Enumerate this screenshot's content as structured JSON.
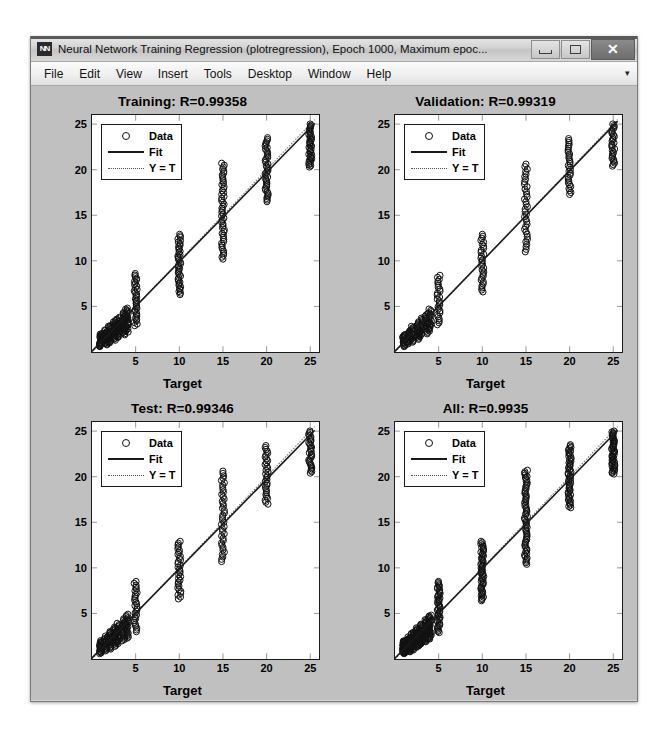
{
  "window": {
    "title": "Neural Network Training Regression (plotregression), Epoch 1000, Maximum epoc...",
    "app_icon": "matlab-nn-icon",
    "controls": {
      "minimize": "minimize-button",
      "maximize": "maximize-button",
      "close": "✕"
    }
  },
  "menubar": {
    "items": [
      {
        "label": "File"
      },
      {
        "label": "Edit"
      },
      {
        "label": "View"
      },
      {
        "label": "Insert"
      },
      {
        "label": "Tools"
      },
      {
        "label": "Desktop"
      },
      {
        "label": "Window"
      },
      {
        "label": "Help"
      }
    ],
    "overflow": "▾"
  },
  "colors": {
    "figure_bg": "#c0c0c0",
    "axes_bg": "#ffffff",
    "data_marker": "#111111",
    "fit_line": "#1a1a1a",
    "identity_line": "#777777",
    "title_bar": "#d2d2d2"
  },
  "legend": {
    "entries": [
      {
        "label": "Data",
        "key": "circle-marker"
      },
      {
        "label": "Fit",
        "key": "solid-line"
      },
      {
        "label": "Y = T",
        "key": "dotted-line"
      }
    ]
  },
  "chart_data": [
    {
      "type": "scatter",
      "name": "training",
      "title": "Training: R=0.99358",
      "xlabel": "Target",
      "ylabel": "Output ~= 0.98*Target + 0.1",
      "r_value": 0.99358,
      "slope": 0.98,
      "intercept": 0.1,
      "xlim": [
        0,
        26
      ],
      "ylim": [
        0,
        26
      ],
      "xticks": [
        5,
        10,
        15,
        20,
        25
      ],
      "yticks": [
        5,
        10,
        15,
        20,
        25
      ],
      "grid": false,
      "legend_position": "upper-left",
      "clusters": [
        {
          "x": 1,
          "y_min": 0.6,
          "y_max": 2.0,
          "n": 26
        },
        {
          "x": 1.6,
          "y_min": 0.8,
          "y_max": 2.4,
          "n": 22
        },
        {
          "x": 2,
          "y_min": 1.0,
          "y_max": 2.9,
          "n": 24
        },
        {
          "x": 2.6,
          "y_min": 1.3,
          "y_max": 3.4,
          "n": 22
        },
        {
          "x": 3,
          "y_min": 1.6,
          "y_max": 3.8,
          "n": 22
        },
        {
          "x": 3.6,
          "y_min": 1.9,
          "y_max": 4.3,
          "n": 22
        },
        {
          "x": 4,
          "y_min": 2.2,
          "y_max": 4.8,
          "n": 24
        },
        {
          "x": 5,
          "y_min": 2.9,
          "y_max": 8.6,
          "n": 34
        },
        {
          "x": 10,
          "y_min": 6.3,
          "y_max": 12.9,
          "n": 40
        },
        {
          "x": 15,
          "y_min": 10.2,
          "y_max": 20.7,
          "n": 50
        },
        {
          "x": 20,
          "y_min": 16.5,
          "y_max": 23.5,
          "n": 40
        },
        {
          "x": 25,
          "y_min": 20.3,
          "y_max": 25.0,
          "n": 38
        }
      ],
      "fit_line": {
        "x0": 0,
        "y0": 0.1,
        "x1": 25.5,
        "y1": 25.09
      },
      "identity_line": {
        "x0": 0,
        "y0": 0,
        "x1": 25.5,
        "y1": 25.5
      }
    },
    {
      "type": "scatter",
      "name": "validation",
      "title": "Validation: R=0.99319",
      "xlabel": "Target",
      "ylabel": "Output ~= 0.99*Target + 0.083",
      "r_value": 0.99319,
      "slope": 0.99,
      "intercept": 0.083,
      "xlim": [
        0,
        26
      ],
      "ylim": [
        0,
        26
      ],
      "xticks": [
        5,
        10,
        15,
        20,
        25
      ],
      "yticks": [
        5,
        10,
        15,
        20,
        25
      ],
      "grid": false,
      "legend_position": "upper-left",
      "clusters": [
        {
          "x": 1,
          "y_min": 0.6,
          "y_max": 1.9,
          "n": 18
        },
        {
          "x": 1.6,
          "y_min": 0.9,
          "y_max": 2.3,
          "n": 16
        },
        {
          "x": 2,
          "y_min": 1.1,
          "y_max": 2.8,
          "n": 18
        },
        {
          "x": 2.6,
          "y_min": 1.4,
          "y_max": 3.3,
          "n": 16
        },
        {
          "x": 3,
          "y_min": 1.7,
          "y_max": 3.7,
          "n": 16
        },
        {
          "x": 3.6,
          "y_min": 2.0,
          "y_max": 4.2,
          "n": 16
        },
        {
          "x": 4,
          "y_min": 2.3,
          "y_max": 4.7,
          "n": 18
        },
        {
          "x": 5,
          "y_min": 3.0,
          "y_max": 8.4,
          "n": 26
        },
        {
          "x": 10,
          "y_min": 6.6,
          "y_max": 12.9,
          "n": 30
        },
        {
          "x": 15,
          "y_min": 11.0,
          "y_max": 20.6,
          "n": 36
        },
        {
          "x": 20,
          "y_min": 17.3,
          "y_max": 23.4,
          "n": 30
        },
        {
          "x": 25,
          "y_min": 20.4,
          "y_max": 25.0,
          "n": 28
        }
      ],
      "fit_line": {
        "x0": 0,
        "y0": 0.083,
        "x1": 25.5,
        "y1": 25.33
      },
      "identity_line": {
        "x0": 0,
        "y0": 0,
        "x1": 25.5,
        "y1": 25.5
      }
    },
    {
      "type": "scatter",
      "name": "test",
      "title": "Test: R=0.99346",
      "xlabel": "Target",
      "ylabel": "Output ~= 0.98*Target + 0.11",
      "r_value": 0.99346,
      "slope": 0.98,
      "intercept": 0.11,
      "xlim": [
        0,
        26
      ],
      "ylim": [
        0,
        26
      ],
      "xticks": [
        5,
        10,
        15,
        20,
        25
      ],
      "yticks": [
        5,
        10,
        15,
        20,
        25
      ],
      "grid": false,
      "legend_position": "upper-left",
      "clusters": [
        {
          "x": 1,
          "y_min": 0.6,
          "y_max": 2.0,
          "n": 20
        },
        {
          "x": 1.6,
          "y_min": 0.9,
          "y_max": 2.5,
          "n": 18
        },
        {
          "x": 2,
          "y_min": 1.1,
          "y_max": 3.0,
          "n": 20
        },
        {
          "x": 2.6,
          "y_min": 1.4,
          "y_max": 3.5,
          "n": 18
        },
        {
          "x": 3,
          "y_min": 1.7,
          "y_max": 3.9,
          "n": 18
        },
        {
          "x": 3.6,
          "y_min": 2.0,
          "y_max": 4.4,
          "n": 18
        },
        {
          "x": 4,
          "y_min": 2.3,
          "y_max": 4.9,
          "n": 20
        },
        {
          "x": 5,
          "y_min": 3.0,
          "y_max": 8.5,
          "n": 28
        },
        {
          "x": 10,
          "y_min": 6.6,
          "y_max": 12.9,
          "n": 32
        },
        {
          "x": 15,
          "y_min": 10.7,
          "y_max": 20.6,
          "n": 40
        },
        {
          "x": 20,
          "y_min": 17.0,
          "y_max": 23.4,
          "n": 32
        },
        {
          "x": 25,
          "y_min": 20.4,
          "y_max": 25.0,
          "n": 30
        }
      ],
      "fit_line": {
        "x0": 0,
        "y0": 0.11,
        "x1": 25.5,
        "y1": 25.1
      },
      "identity_line": {
        "x0": 0,
        "y0": 0,
        "x1": 25.5,
        "y1": 25.5
      }
    },
    {
      "type": "scatter",
      "name": "all",
      "title": "All: R=0.9935",
      "xlabel": "Target",
      "ylabel": "Output ~= 0.98*Target + 0.099",
      "r_value": 0.9935,
      "slope": 0.98,
      "intercept": 0.099,
      "xlim": [
        0,
        26
      ],
      "ylim": [
        0,
        26
      ],
      "xticks": [
        5,
        10,
        15,
        20,
        25
      ],
      "yticks": [
        5,
        10,
        15,
        20,
        25
      ],
      "grid": false,
      "legend_position": "upper-left",
      "clusters": [
        {
          "x": 1,
          "y_min": 0.6,
          "y_max": 2.0,
          "n": 34
        },
        {
          "x": 1.6,
          "y_min": 0.8,
          "y_max": 2.4,
          "n": 30
        },
        {
          "x": 2,
          "y_min": 1.0,
          "y_max": 2.9,
          "n": 32
        },
        {
          "x": 2.6,
          "y_min": 1.3,
          "y_max": 3.4,
          "n": 30
        },
        {
          "x": 3,
          "y_min": 1.6,
          "y_max": 3.8,
          "n": 30
        },
        {
          "x": 3.6,
          "y_min": 1.9,
          "y_max": 4.3,
          "n": 30
        },
        {
          "x": 4,
          "y_min": 2.2,
          "y_max": 4.8,
          "n": 32
        },
        {
          "x": 5,
          "y_min": 2.9,
          "y_max": 8.5,
          "n": 44
        },
        {
          "x": 10,
          "y_min": 6.4,
          "y_max": 12.9,
          "n": 50
        },
        {
          "x": 15,
          "y_min": 10.4,
          "y_max": 20.7,
          "n": 62
        },
        {
          "x": 20,
          "y_min": 16.6,
          "y_max": 23.5,
          "n": 50
        },
        {
          "x": 25,
          "y_min": 20.3,
          "y_max": 25.0,
          "n": 48
        }
      ],
      "fit_line": {
        "x0": 0,
        "y0": 0.099,
        "x1": 25.5,
        "y1": 25.09
      },
      "identity_line": {
        "x0": 0,
        "y0": 0,
        "x1": 25.5,
        "y1": 25.5
      }
    }
  ]
}
